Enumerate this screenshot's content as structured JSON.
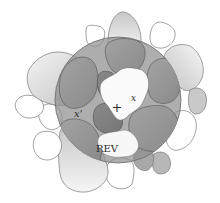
{
  "figure": {
    "labels": {
      "center_point": "x",
      "other_point": "x'",
      "marker": "+",
      "rev": "REV"
    },
    "rev_circle": {
      "cx": 118,
      "cy": 100,
      "r": 63
    },
    "colors": {
      "background": "#ffffff",
      "outline": "#6e6e6e",
      "grain_outside_light": "#f2f2f2",
      "grain_outside_dark": "#bdbdbd",
      "grain_inside_light": "#a9a9a9",
      "grain_inside_dark": "#7d7d7d",
      "rev_fill": "#8c8c8c",
      "pore": "#fafafa",
      "text": "#2a2a2a"
    }
  }
}
